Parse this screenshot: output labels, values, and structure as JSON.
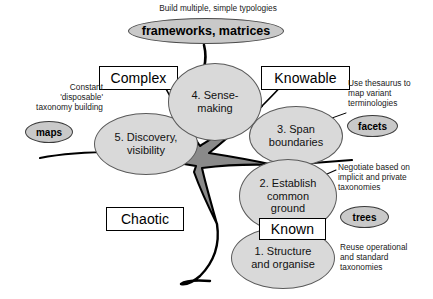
{
  "diagram": {
    "title_caption": "Build multiple, simple typologies",
    "banner": {
      "label": "frameworks, matrices"
    },
    "quadrants": [
      {
        "id": "complex",
        "label": "Complex"
      },
      {
        "id": "knowable",
        "label": "Knowable"
      },
      {
        "id": "chaotic",
        "label": "Chaotic"
      },
      {
        "id": "known",
        "label": "Known"
      }
    ],
    "nodes": [
      {
        "id": "sense-making",
        "label": "4. Sense-\nmaking"
      },
      {
        "id": "discovery",
        "label": "5. Discovery,\nvisibility"
      },
      {
        "id": "span-boundaries",
        "label": "3. Span\nboundaries"
      },
      {
        "id": "common-ground",
        "label": "2. Establish\ncommon\nground"
      },
      {
        "id": "structure-organise",
        "label": "1. Structure\nand organise"
      }
    ],
    "pills": [
      {
        "id": "maps",
        "label": "maps"
      },
      {
        "id": "facets",
        "label": "facets"
      },
      {
        "id": "trees",
        "label": "trees"
      }
    ],
    "annotations": [
      {
        "id": "complex-note",
        "text": "Constant\n'disposable'\ntaxonomy building"
      },
      {
        "id": "knowable-note",
        "text": "Use thesaurus to\nmap variant\nterminologies"
      },
      {
        "id": "common-ground-note",
        "text": "Negotiate based on\nimplicit and private\ntaxonomies"
      },
      {
        "id": "known-note",
        "text": "Reuse operational\nand standard\ntaxonomies"
      }
    ],
    "colors": {
      "node_fill": "#d9d9d9",
      "node_stroke": "#5a5a5a",
      "pill_fill": "#c9c9c9",
      "center_fill": "#8c8c8c",
      "line": "#000000"
    }
  }
}
